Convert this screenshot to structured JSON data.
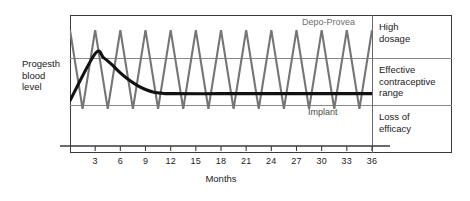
{
  "chart_data": {
    "type": "line",
    "title": "",
    "xlabel": "Months",
    "ylabel": "Progesth blood level",
    "xlim": [
      0,
      36
    ],
    "ylim": [
      0,
      100
    ],
    "grid": false,
    "legend_position": "inline",
    "xticks": [
      3,
      6,
      9,
      12,
      15,
      18,
      21,
      24,
      27,
      30,
      33,
      36
    ],
    "xtick_labels": [
      "3",
      "6",
      "9",
      "12",
      "15",
      "18",
      "21",
      "24",
      "27",
      "30",
      "33",
      "36"
    ],
    "bands": [
      {
        "name": "High dosage",
        "y_from": 71,
        "y_to": 100
      },
      {
        "name": "Effective contraceptive range",
        "y_from": 37,
        "y_to": 71
      },
      {
        "name": "Loss of efficacy",
        "y_from": 0,
        "y_to": 37
      }
    ],
    "series": [
      {
        "name": "Depo-Provea",
        "color": "#757575",
        "style": "sawtooth",
        "note": "Injection every 3 months; peaks in high dosage band, troughs fall to edge of loss of efficacy",
        "peak_y": 89,
        "trough_y": 32,
        "points": [
          [
            0,
            89
          ],
          [
            1.5,
            32
          ],
          [
            3,
            89
          ],
          [
            4.5,
            32
          ],
          [
            6,
            89
          ],
          [
            7.5,
            32
          ],
          [
            9,
            89
          ],
          [
            10.5,
            32
          ],
          [
            12,
            89
          ],
          [
            13.5,
            32
          ],
          [
            15,
            89
          ],
          [
            16.5,
            32
          ],
          [
            18,
            89
          ],
          [
            19.5,
            32
          ],
          [
            21,
            89
          ],
          [
            22.5,
            32
          ],
          [
            24,
            89
          ],
          [
            25.5,
            32
          ],
          [
            27,
            89
          ],
          [
            28.5,
            32
          ],
          [
            30,
            89
          ],
          [
            31.5,
            32
          ],
          [
            33,
            89
          ],
          [
            34.5,
            32
          ],
          [
            36,
            89
          ]
        ]
      },
      {
        "name": "Implant",
        "color": "#111111",
        "style": "rise-decay-plateau",
        "note": "Rises to peak at month 3 then decays to a steady plateau within the effective contraceptive range",
        "peak_month": 3,
        "peak_y": 72,
        "plateau_y": 43,
        "points": [
          [
            0,
            38
          ],
          [
            3,
            72
          ],
          [
            4,
            69
          ],
          [
            5,
            64
          ],
          [
            6,
            58
          ],
          [
            7,
            53
          ],
          [
            8,
            49
          ],
          [
            9,
            46
          ],
          [
            10,
            44
          ],
          [
            11,
            43.3
          ],
          [
            12,
            43
          ],
          [
            18,
            43
          ],
          [
            24,
            43
          ],
          [
            30,
            43
          ],
          [
            36,
            43
          ]
        ]
      }
    ],
    "annotations": [
      {
        "text": "Depo-Provea",
        "series": "Depo-Provea",
        "position": "top-right"
      },
      {
        "text": "Implant",
        "series": "Implant",
        "position": "below-plateau-right"
      }
    ]
  },
  "axis": {
    "y_label_lines": [
      "Progesth",
      "blood",
      "level"
    ],
    "x_title": "Months"
  },
  "legend_column": {
    "cells": [
      {
        "lines": [
          "High",
          "dosage"
        ]
      },
      {
        "lines": [
          "Effective",
          "contraceptive",
          "range"
        ]
      },
      {
        "lines": [
          "Loss of",
          "efficacy"
        ]
      }
    ]
  },
  "colors": {
    "depo_line": "#757575",
    "implant_line": "#111111",
    "frame": "#3a3a3a",
    "divider": "#8a8a8a",
    "text": "#1a1a1a",
    "background": "#ffffff"
  }
}
